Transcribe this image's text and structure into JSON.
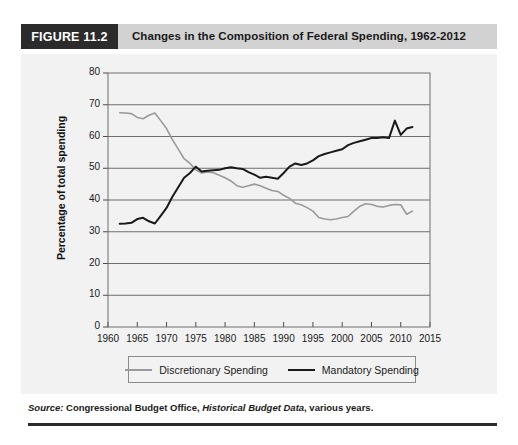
{
  "figure": {
    "tag": "FIGURE 11.2",
    "title": "Changes in the Composition of Federal Spending, 1962-2012",
    "source_label": "Source:",
    "source_agency": " Congressional Budget Office, ",
    "source_publication": "Historical Budget Data",
    "source_suffix": ", various years."
  },
  "colors": {
    "tag_background": "#2b2b2b",
    "header_background": "#d2d2d2",
    "panel_background": "#f2f2f2",
    "discretionary_line": "#9a9a9a",
    "mandatory_line": "#1a1a1a",
    "gridline": "#6e6e6e",
    "axis": "#4a4a4a"
  },
  "legend": {
    "position": "bottom-center",
    "items": [
      {
        "label": "Discretionary Spending",
        "key": "discretionary"
      },
      {
        "label": "Mandatory Spending",
        "key": "mandatory"
      }
    ]
  },
  "chart_data": {
    "type": "line",
    "title": "Changes in the Composition of Federal Spending, 1962-2012",
    "xlabel": "",
    "ylabel": "Percentage of total spending",
    "xlim": [
      1960,
      2015
    ],
    "ylim": [
      0,
      80
    ],
    "xticks": [
      1960,
      1965,
      1970,
      1975,
      1980,
      1985,
      1990,
      1995,
      2000,
      2005,
      2010,
      2015
    ],
    "yticks": [
      0,
      10,
      20,
      30,
      40,
      50,
      60,
      70,
      80
    ],
    "grid": "horizontal",
    "x": [
      1962,
      1963,
      1964,
      1965,
      1966,
      1967,
      1968,
      1969,
      1970,
      1971,
      1972,
      1973,
      1974,
      1975,
      1976,
      1977,
      1978,
      1979,
      1980,
      1981,
      1982,
      1983,
      1984,
      1985,
      1986,
      1987,
      1988,
      1989,
      1990,
      1991,
      1992,
      1993,
      1994,
      1995,
      1996,
      1997,
      1998,
      1999,
      2000,
      2001,
      2002,
      2003,
      2004,
      2005,
      2006,
      2007,
      2008,
      2009,
      2010,
      2011,
      2012
    ],
    "series": [
      {
        "name": "Discretionary Spending",
        "color": "#9a9a9a",
        "values": [
          67.5,
          67.4,
          67.2,
          66.0,
          65.6,
          66.7,
          67.4,
          65.0,
          62.5,
          59.0,
          56.0,
          53.0,
          51.5,
          49.5,
          48.5,
          48.8,
          48.6,
          47.8,
          47.0,
          46.0,
          44.5,
          44.0,
          44.5,
          45.0,
          44.5,
          43.7,
          43.0,
          42.7,
          41.5,
          40.5,
          39.0,
          38.5,
          37.6,
          36.5,
          34.5,
          34.0,
          33.8,
          34.0,
          34.5,
          34.8,
          36.5,
          38.0,
          38.8,
          38.6,
          38.0,
          37.8,
          38.3,
          38.6,
          38.5,
          35.5,
          36.5
        ]
      },
      {
        "name": "Mandatory Spending",
        "color": "#1a1a1a",
        "values": [
          32.5,
          32.6,
          32.8,
          34.0,
          34.4,
          33.3,
          32.6,
          35.0,
          37.5,
          41.0,
          44.0,
          47.0,
          48.5,
          50.5,
          49.0,
          49.2,
          49.4,
          49.5,
          50.0,
          50.3,
          50.0,
          49.8,
          48.8,
          48.0,
          47.0,
          47.3,
          47.0,
          46.7,
          48.5,
          50.5,
          51.5,
          51.0,
          51.5,
          52.5,
          53.8,
          54.5,
          55.0,
          55.5,
          56.0,
          57.3,
          58.0,
          58.5,
          59.0,
          59.5,
          59.5,
          59.8,
          59.5,
          65.0,
          60.5,
          62.5,
          63.0
        ]
      }
    ]
  }
}
